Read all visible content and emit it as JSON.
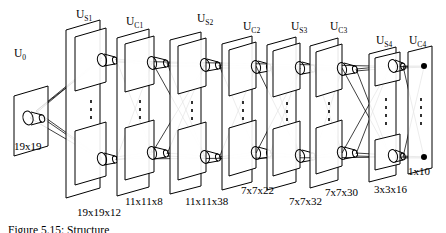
{
  "figure": {
    "caption": "Figure 5.15:  Structure",
    "background_color": "#ffffff",
    "ink_color": "#000000"
  },
  "layer_labels": [
    {
      "id": "u0",
      "base": "U",
      "sub": "0",
      "text": "U0",
      "x": 14,
      "y": 48
    },
    {
      "id": "us1",
      "base": "U",
      "sub": "S1",
      "text": "US1",
      "x": 76,
      "y": 9
    },
    {
      "id": "uc1",
      "base": "U",
      "sub": "C1",
      "text": "UC1",
      "x": 126,
      "y": 16
    },
    {
      "id": "us2",
      "base": "U",
      "sub": "S2",
      "text": "US2",
      "x": 197,
      "y": 13
    },
    {
      "id": "uc2",
      "base": "U",
      "sub": "C2",
      "text": "UC2",
      "x": 243,
      "y": 21
    },
    {
      "id": "us3",
      "base": "U",
      "sub": "S3",
      "text": "US3",
      "x": 291,
      "y": 21
    },
    {
      "id": "uc3",
      "base": "U",
      "sub": "C3",
      "text": "UC3",
      "x": 330,
      "y": 21
    },
    {
      "id": "us4",
      "base": "U",
      "sub": "S4",
      "text": "US4",
      "x": 376,
      "y": 35
    },
    {
      "id": "uc4",
      "base": "U",
      "sub": "C4",
      "text": "UC4",
      "x": 409,
      "y": 35
    }
  ],
  "dimension_labels": [
    {
      "id": "dim-u0",
      "text": "19x19",
      "x": 14,
      "y": 141
    },
    {
      "id": "dim-us1",
      "text": "19x19x12",
      "x": 77,
      "y": 207
    },
    {
      "id": "dim-uc1",
      "text": "11x11x8",
      "x": 125,
      "y": 196
    },
    {
      "id": "dim-us2",
      "text": "11x11x38",
      "x": 185,
      "y": 196
    },
    {
      "id": "dim-uc2",
      "text": "7x7x22",
      "x": 241,
      "y": 185
    },
    {
      "id": "dim-us3",
      "text": "7x7x32",
      "x": 289,
      "y": 196
    },
    {
      "id": "dim-uc3",
      "text": "7x7x30",
      "x": 325,
      "y": 187
    },
    {
      "id": "dim-us4",
      "text": "3x3x16",
      "x": 374,
      "y": 184
    },
    {
      "id": "dim-uc4",
      "text": "1x10",
      "x": 408,
      "y": 166
    }
  ],
  "layers": [
    {
      "id": "u0",
      "name": "input-layer",
      "dim": "19x19",
      "cells": 1
    },
    {
      "id": "us1",
      "name": "simple-layer-1",
      "dim": "19x19x12",
      "cells": 12
    },
    {
      "id": "uc1",
      "name": "complex-layer-1",
      "dim": "11x11x8",
      "cells": 8
    },
    {
      "id": "us2",
      "name": "simple-layer-2",
      "dim": "11x11x38",
      "cells": 38
    },
    {
      "id": "uc2",
      "name": "complex-layer-2",
      "dim": "7x7x22",
      "cells": 22
    },
    {
      "id": "us3",
      "name": "simple-layer-3",
      "dim": "7x7x32",
      "cells": 32
    },
    {
      "id": "uc3",
      "name": "complex-layer-3",
      "dim": "7x7x30",
      "cells": 30
    },
    {
      "id": "us4",
      "name": "simple-layer-4",
      "dim": "3x3x16",
      "cells": 16
    },
    {
      "id": "uc4",
      "name": "output-layer",
      "dim": "1x10",
      "cells": 10
    }
  ],
  "style": {
    "stroke_width_plane": 1.0,
    "stroke_width_connection": 0.8,
    "dot_radius": 3.0
  }
}
